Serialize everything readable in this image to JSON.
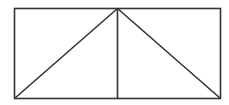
{
  "diagram": {
    "type": "geometric-figure",
    "stroke_color": "#333333",
    "stroke_width": 1.6,
    "background": "#ffffff",
    "rectangle": {
      "x1": 14.5,
      "y1": 8.5,
      "x2": 220.5,
      "y2": 98.5
    },
    "apex": {
      "x": 117.5,
      "y": 8.5
    },
    "segments": [
      {
        "name": "left-diagonal",
        "x1": 117.5,
        "y1": 8.5,
        "x2": 14.5,
        "y2": 98.5
      },
      {
        "name": "right-diagonal",
        "x1": 117.5,
        "y1": 8.5,
        "x2": 220.5,
        "y2": 98.5
      },
      {
        "name": "vertical-line",
        "x1": 117.5,
        "y1": 8.5,
        "x2": 117.5,
        "y2": 98.5
      }
    ]
  }
}
